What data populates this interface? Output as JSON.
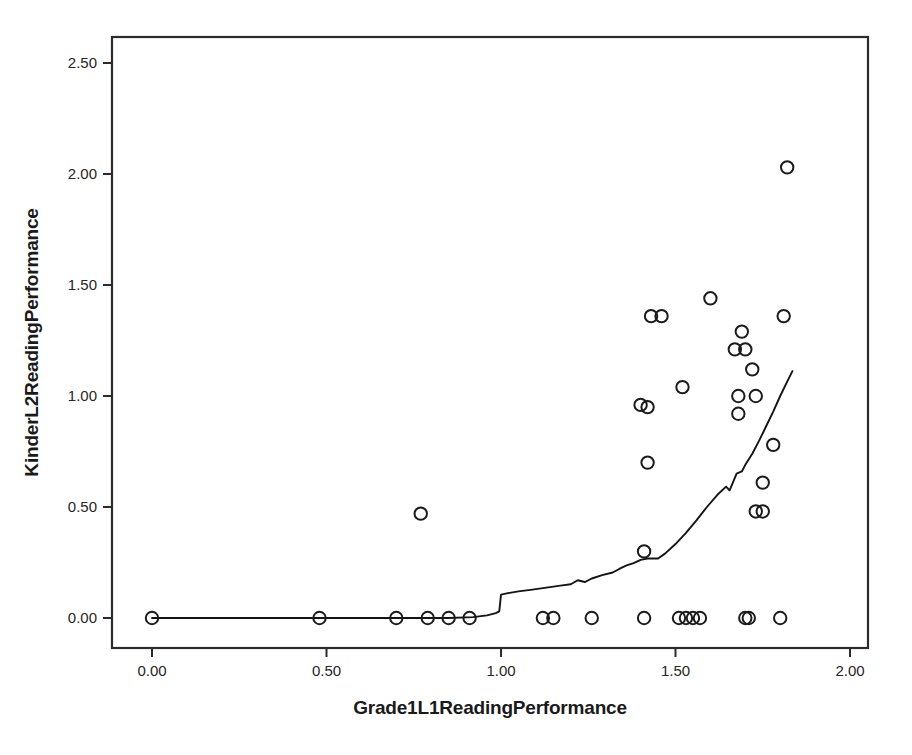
{
  "chart_data": {
    "type": "scatter",
    "title": "",
    "xlabel": "Grade1L1ReadingPerformance",
    "ylabel": "KinderL2ReadingPerformance",
    "xlim": [
      -0.115,
      2.115
    ],
    "ylim": [
      -0.135,
      2.635
    ],
    "xticks": [
      0.0,
      0.5,
      1.0,
      1.5,
      2.0
    ],
    "xticklabels": [
      "0.00",
      "0.50",
      "1.00",
      "1.50",
      "2.00"
    ],
    "yticks": [
      0.0,
      0.5,
      1.0,
      1.5,
      2.0,
      2.5
    ],
    "yticklabels": [
      "0.00",
      "0.50",
      "1.00",
      "1.50",
      "2.00",
      "2.50"
    ],
    "grid": false,
    "legend": null,
    "marker_style": "open-circle",
    "marker_color": "#1b1b1b",
    "line_color": "#141414",
    "points": [
      [
        0.0,
        0.0
      ],
      [
        0.48,
        0.0
      ],
      [
        0.7,
        0.0
      ],
      [
        0.77,
        0.47
      ],
      [
        0.79,
        0.0
      ],
      [
        0.85,
        0.0
      ],
      [
        0.91,
        0.0
      ],
      [
        1.12,
        0.0
      ],
      [
        1.15,
        0.0
      ],
      [
        1.26,
        0.0
      ],
      [
        1.4,
        0.96
      ],
      [
        1.42,
        0.95
      ],
      [
        1.41,
        0.0
      ],
      [
        1.41,
        0.3
      ],
      [
        1.42,
        0.7
      ],
      [
        1.46,
        1.36
      ],
      [
        1.51,
        0.0
      ],
      [
        1.52,
        1.04
      ],
      [
        1.53,
        0.0
      ],
      [
        1.55,
        0.0
      ],
      [
        1.57,
        0.0
      ],
      [
        1.6,
        1.44
      ],
      [
        1.67,
        1.21
      ],
      [
        1.68,
        1.0
      ],
      [
        1.68,
        0.92
      ],
      [
        1.69,
        1.29
      ],
      [
        1.7,
        1.21
      ],
      [
        1.7,
        0.0
      ],
      [
        1.71,
        0.0
      ],
      [
        1.72,
        1.12
      ],
      [
        1.73,
        1.0
      ],
      [
        1.73,
        0.48
      ],
      [
        1.75,
        0.48
      ],
      [
        1.75,
        0.61
      ],
      [
        1.78,
        0.78
      ],
      [
        1.8,
        0.0
      ],
      [
        1.81,
        1.36
      ],
      [
        1.82,
        2.03
      ],
      [
        1.43,
        1.36
      ]
    ],
    "fit_line": {
      "name": "loess-fit-line",
      "points": [
        [
          0.0,
          0.0
        ],
        [
          0.2,
          0.0
        ],
        [
          0.4,
          0.0
        ],
        [
          0.6,
          0.0
        ],
        [
          0.75,
          0.0
        ],
        [
          0.85,
          0.0
        ],
        [
          0.92,
          0.004
        ],
        [
          0.96,
          0.012
        ],
        [
          0.985,
          0.022
        ],
        [
          0.995,
          0.03
        ],
        [
          1.0,
          0.105
        ],
        [
          1.02,
          0.112
        ],
        [
          1.05,
          0.12
        ],
        [
          1.09,
          0.128
        ],
        [
          1.13,
          0.137
        ],
        [
          1.17,
          0.146
        ],
        [
          1.2,
          0.152
        ],
        [
          1.22,
          0.17
        ],
        [
          1.24,
          0.162
        ],
        [
          1.26,
          0.178
        ],
        [
          1.29,
          0.193
        ],
        [
          1.32,
          0.205
        ],
        [
          1.34,
          0.222
        ],
        [
          1.36,
          0.237
        ],
        [
          1.38,
          0.247
        ],
        [
          1.4,
          0.262
        ],
        [
          1.42,
          0.268
        ],
        [
          1.45,
          0.268
        ],
        [
          1.47,
          0.29
        ],
        [
          1.5,
          0.333
        ],
        [
          1.53,
          0.383
        ],
        [
          1.56,
          0.44
        ],
        [
          1.59,
          0.5
        ],
        [
          1.62,
          0.555
        ],
        [
          1.645,
          0.592
        ],
        [
          1.655,
          0.575
        ],
        [
          1.665,
          0.612
        ],
        [
          1.675,
          0.65
        ],
        [
          1.69,
          0.66
        ],
        [
          1.7,
          0.69
        ],
        [
          1.72,
          0.74
        ],
        [
          1.74,
          0.8
        ],
        [
          1.76,
          0.865
        ],
        [
          1.78,
          0.93
        ],
        [
          1.8,
          1.0
        ],
        [
          1.82,
          1.065
        ],
        [
          1.835,
          1.112
        ]
      ]
    }
  },
  "geometry": {
    "plot_left": 112,
    "plot_top": 37,
    "plot_right": 868,
    "plot_bottom": 648,
    "x0_px": 152,
    "x_per_unit_px": 349,
    "y0_px": 618,
    "y_per_unit_px": 222,
    "marker_radius": 6.2
  }
}
